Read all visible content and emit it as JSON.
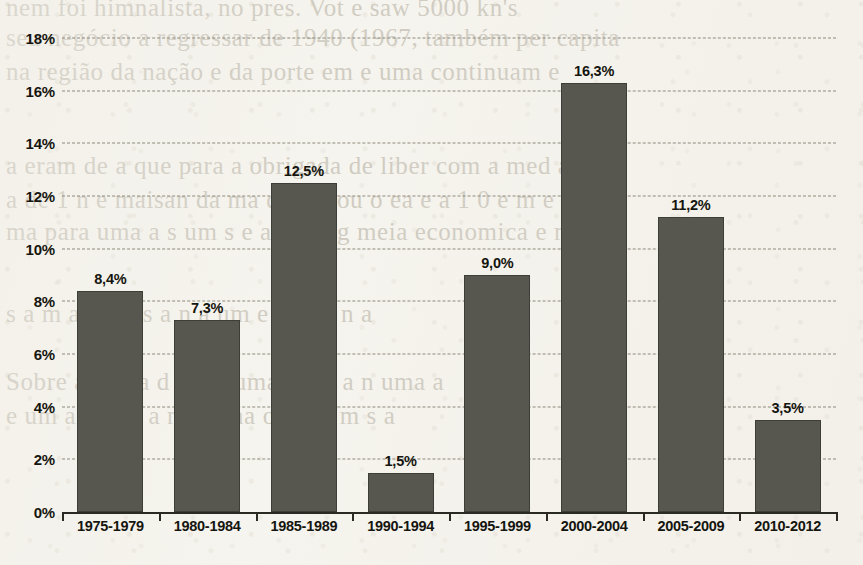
{
  "page": {
    "background_color": "#f6f4ee",
    "bleed_through_lines": [
      {
        "text": "nem foi himnalista, no pres. Vot e saw 5000 kn's",
        "x": 6,
        "y": -6
      },
      {
        "text": "seu negócio a regressar de 1940 (1967, também per capita",
        "x": 6,
        "y": 24
      },
      {
        "text": "na região da nação e da porte em e uma continuam e",
        "x": 6,
        "y": 58
      },
      {
        "text": "a eram de a que para a obrigada de  liber com a med a n",
        "x": 6,
        "y": 152
      },
      {
        "text": "a de 1 n  e maisan  da  ma de dia  ou  o ea  e  a  1 0 e m e",
        "x": 6,
        "y": 186
      },
      {
        "text": "ma para  uma a s  um s  e  a  ma  n g  meia economica e  m a",
        "x": 6,
        "y": 218
      },
      {
        "text": "s a m a  e  e   a  s  a  n  a  um e  a  m  o   n a",
        "x": 6,
        "y": 300
      },
      {
        "text": "Sobre  a  e  m  a  d  e  n  a  uma  a  o  e a  n  uma  a",
        "x": 6,
        "y": 368
      },
      {
        "text": "e  um  a  o a  m  a  n  a  e  ma  o  n  e  a  m  s  a",
        "x": 6,
        "y": 402
      }
    ]
  },
  "chart_data": {
    "type": "bar",
    "title": "",
    "subtitle": "",
    "xlabel": "",
    "ylabel": "",
    "categories": [
      "1975-1979",
      "1980-1984",
      "1985-1989",
      "1990-1994",
      "1995-1999",
      "2000-2004",
      "2005-2009",
      "2010-2012"
    ],
    "values": [
      8.4,
      7.3,
      12.5,
      1.5,
      9.0,
      16.3,
      11.2,
      3.5
    ],
    "data_labels": [
      "8,4%",
      "7,3%",
      "12,5%",
      "1,5%",
      "9,0%",
      "16,3%",
      "11,2%",
      "3,5%"
    ],
    "ylim": [
      0,
      18
    ],
    "ytick_values": [
      0,
      2,
      4,
      6,
      8,
      10,
      12,
      14,
      16,
      18
    ],
    "ytick_labels": [
      "0%",
      "2%",
      "4%",
      "6%",
      "8%",
      "10%",
      "12%",
      "14%",
      "16%",
      "18%"
    ],
    "grid": true,
    "grid_style": "dashed-horizontal",
    "legend": false,
    "legend_position": "none",
    "bar_color": "#575750",
    "text_color": "#15150f",
    "grid_color": "#8e897c",
    "axis_color": "#2a2a22",
    "decimal_separator": ","
  }
}
